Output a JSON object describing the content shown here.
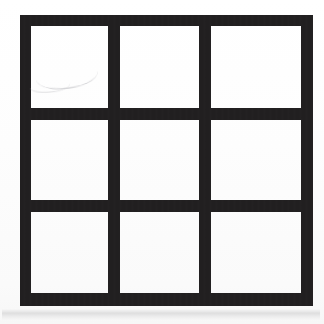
{
  "figure": {
    "name": "three-by-three-grid",
    "rows": 3,
    "columns": 3,
    "cell_count": 9,
    "stroke_color": "#211f20",
    "cell_fill_color": "#ffffff",
    "background_color": "#fbfbfb",
    "stroke_width_px": 12,
    "outer_bounds": {
      "left": 20,
      "top": 15,
      "width": 293,
      "height": 291
    },
    "vertical_divider_x": [
      114,
      205
    ],
    "horizontal_divider_y": [
      115,
      206
    ]
  },
  "cells": [
    {
      "id": "cell-r1c1",
      "row": 1,
      "column": 1,
      "label": "",
      "state": "empty"
    },
    {
      "id": "cell-r1c2",
      "row": 1,
      "column": 2,
      "label": "",
      "state": "empty"
    },
    {
      "id": "cell-r1c3",
      "row": 1,
      "column": 3,
      "label": "",
      "state": "empty"
    },
    {
      "id": "cell-r2c1",
      "row": 2,
      "column": 1,
      "label": "",
      "state": "empty"
    },
    {
      "id": "cell-r2c2",
      "row": 2,
      "column": 2,
      "label": "",
      "state": "empty"
    },
    {
      "id": "cell-r2c3",
      "row": 2,
      "column": 3,
      "label": "",
      "state": "empty"
    },
    {
      "id": "cell-r3c1",
      "row": 3,
      "column": 1,
      "label": "",
      "state": "empty"
    },
    {
      "id": "cell-r3c2",
      "row": 3,
      "column": 2,
      "label": "",
      "state": "empty"
    },
    {
      "id": "cell-r3c3",
      "row": 3,
      "column": 3,
      "label": "",
      "state": "empty"
    }
  ],
  "artifacts": {
    "smudge_top_left_cell": "faint curved pencil smudge",
    "shadow_below_figure": "faint gray smear band under the bottom edge"
  }
}
